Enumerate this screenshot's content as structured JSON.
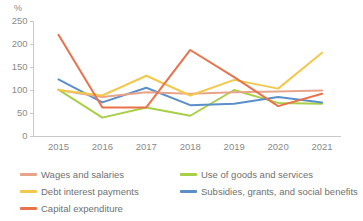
{
  "chart_data": {
    "type": "line",
    "title": "",
    "xlabel": "",
    "ylabel": "%",
    "unit_label": "%",
    "categories": [
      "2015",
      "2016",
      "2017",
      "2018",
      "2019",
      "2020",
      "2021"
    ],
    "x": [
      2015,
      2016,
      2017,
      2018,
      2019,
      2020,
      2021
    ],
    "ylim": [
      0,
      250
    ],
    "yticks": [
      0,
      50,
      100,
      150,
      200,
      250
    ],
    "ytick_labels": [
      "0",
      "50",
      "100",
      "150",
      "200",
      "250"
    ],
    "grid": false,
    "legend_position": "bottom",
    "series": [
      {
        "name": "Wages and salaries",
        "color": "#E8A48A",
        "values": [
          100,
          85,
          95,
          92,
          95,
          97,
          99
        ]
      },
      {
        "name": "Debt interest payments",
        "color": "#F2C94C",
        "values": [
          100,
          88,
          131,
          88,
          122,
          103,
          181
        ]
      },
      {
        "name": "Capital expenditure",
        "color": "#E9724C",
        "values": [
          220,
          62,
          62,
          187,
          128,
          65,
          92
        ]
      },
      {
        "name": "Use of goods and services",
        "color": "#A8CF45",
        "values": [
          101,
          40,
          62,
          44,
          100,
          72,
          70
        ]
      },
      {
        "name": "Subsidies, grants, and social benefits",
        "color": "#5B8FC9",
        "values": [
          123,
          73,
          105,
          67,
          70,
          85,
          73
        ]
      }
    ]
  }
}
